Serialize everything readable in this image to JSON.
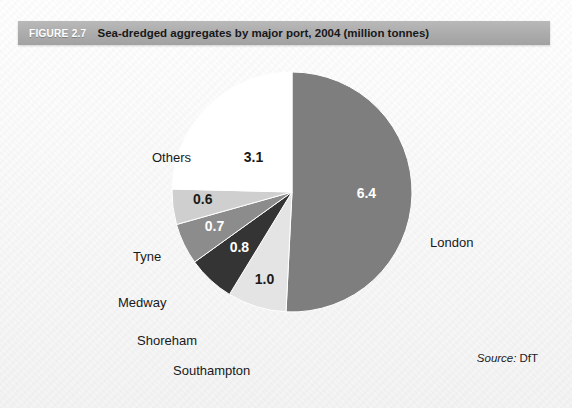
{
  "header": {
    "figure_number": "FIGURE 2.7",
    "title": "Sea-dredged aggregates by major port, 2004 (million tonnes)",
    "band_color": "#ababab",
    "number_color": "#ffffff",
    "title_color": "#17181a"
  },
  "source": {
    "label": "Source:",
    "value": "DfT"
  },
  "chart_data": {
    "type": "pie",
    "title": "Sea-dredged aggregates by major port, 2004 (million tonnes)",
    "unit": "million tonnes",
    "year": "2004",
    "total": 12.6,
    "start_angle_deg": 0,
    "direction": "clockwise",
    "legend": "none-inline-labels",
    "categories": [
      "London",
      "Southampton",
      "Shoreham",
      "Medway",
      "Tyne",
      "Others"
    ],
    "values": [
      6.4,
      1.0,
      0.8,
      0.7,
      0.6,
      3.1
    ],
    "value_labels": [
      "6.4",
      "1.0",
      "0.8",
      "0.7",
      "0.6",
      "3.1"
    ],
    "slices": [
      {
        "name": "London",
        "value": 6.4,
        "value_label": "6.4",
        "color": "#7e7e7e",
        "text_color": "#ffffff"
      },
      {
        "name": "Southampton",
        "value": 1.0,
        "value_label": "1.0",
        "color": "#e4e4e4",
        "text_color": "#1a1a1a"
      },
      {
        "name": "Shoreham",
        "value": 0.8,
        "value_label": "0.8",
        "color": "#343434",
        "text_color": "#ffffff"
      },
      {
        "name": "Medway",
        "value": 0.7,
        "value_label": "0.7",
        "color": "#8c8c8c",
        "text_color": "#ffffff"
      },
      {
        "name": "Tyne",
        "value": 0.6,
        "value_label": "0.6",
        "color": "#cfcfcf",
        "text_color": "#1a1a1a"
      },
      {
        "name": "Others",
        "value": 3.1,
        "value_label": "3.1",
        "color": "#ffffff",
        "text_color": "#1a1a1a"
      }
    ]
  }
}
